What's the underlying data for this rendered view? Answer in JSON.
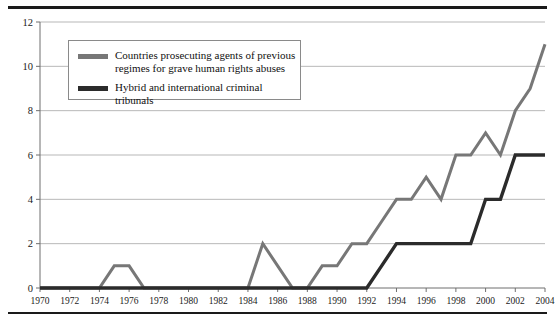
{
  "chart_data": {
    "type": "line",
    "title": "",
    "xlabel": "",
    "ylabel": "",
    "xlim": [
      1970,
      2004
    ],
    "ylim": [
      0,
      12
    ],
    "ytick_step": 2,
    "xtick_step": 2,
    "grid": "horizontal",
    "legend_position": "top-left-inside",
    "x": [
      1970,
      1971,
      1972,
      1973,
      1974,
      1975,
      1976,
      1977,
      1978,
      1979,
      1980,
      1981,
      1982,
      1983,
      1984,
      1985,
      1986,
      1987,
      1988,
      1989,
      1990,
      1991,
      1992,
      1993,
      1994,
      1995,
      1996,
      1997,
      1998,
      1999,
      2000,
      2001,
      2002,
      2003,
      2004
    ],
    "xticklabels": [
      "1970",
      "1972",
      "1974",
      "1976",
      "1978",
      "1980",
      "1982",
      "1984",
      "1986",
      "1988",
      "1990",
      "1992",
      "1994",
      "1996",
      "1998",
      "2000",
      "2002",
      "2004"
    ],
    "yticklabels": [
      "0",
      "2",
      "4",
      "6",
      "8",
      "10",
      "12"
    ],
    "series": [
      {
        "name": "Countries prosecuting agents of previous regimes for grave human rights abuses",
        "color": "#777777",
        "values": [
          0,
          0,
          0,
          0,
          0,
          1,
          1,
          0,
          0,
          0,
          0,
          0,
          0,
          0,
          0,
          2,
          1,
          0,
          0,
          1,
          1,
          2,
          2,
          3,
          4,
          4,
          5,
          4,
          6,
          6,
          7,
          6,
          8,
          9,
          11
        ]
      },
      {
        "name": "Hybrid and international criminal tribunals",
        "color": "#2b2b2b",
        "values": [
          0,
          0,
          0,
          0,
          0,
          0,
          0,
          0,
          0,
          0,
          0,
          0,
          0,
          0,
          0,
          0,
          0,
          0,
          0,
          0,
          0,
          0,
          0,
          1,
          2,
          2,
          2,
          2,
          2,
          2,
          4,
          4,
          6,
          6,
          6
        ]
      }
    ]
  },
  "legend": {
    "items": [
      {
        "label": "Countries prosecuting agents of previous\nregimes for grave human rights abuses",
        "color": "#777777"
      },
      {
        "label": "Hybrid and international criminal tribunals",
        "color": "#2b2b2b"
      }
    ]
  },
  "colors": {
    "grey_series": "#777777",
    "black_series": "#2b2b2b",
    "gridline": "#9a9a9a",
    "axis": "#6f6f6f",
    "rule": "#1a1a1a",
    "text": "#101010"
  }
}
